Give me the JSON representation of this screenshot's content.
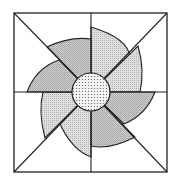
{
  "figure": {
    "square": {
      "x": 14,
      "y": 13,
      "size": 153
    },
    "center": {
      "x": 90.5,
      "y": 92.5
    },
    "center_circle": {
      "radius": 19,
      "fill": "dotted"
    },
    "blade_count": 8,
    "colors": {
      "stroke": "#222222",
      "background": "#ffffff",
      "blade_light": "#d9d9d9",
      "blade_dark": "#c4c4c4",
      "circle": "#eeeeee"
    }
  }
}
